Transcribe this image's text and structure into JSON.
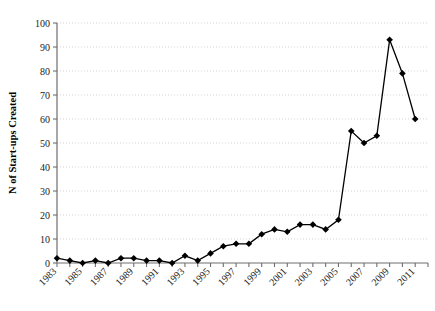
{
  "chart_data": {
    "type": "line",
    "title": "",
    "subtitle": "",
    "xlabel": "",
    "ylabel": "N of Start-ups Created",
    "xlim": [
      1983,
      2012
    ],
    "ylim": [
      0,
      100
    ],
    "ytick_step": 10,
    "yticks": [
      0,
      10,
      20,
      30,
      40,
      50,
      60,
      70,
      80,
      90,
      100
    ],
    "ytick_labels": [
      "0",
      "10",
      "20",
      "30",
      "40",
      "50",
      "60",
      "70",
      "80",
      "90",
      "100"
    ],
    "xticks": [
      1983,
      1984,
      1985,
      1986,
      1987,
      1988,
      1989,
      1990,
      1991,
      1992,
      1993,
      1994,
      1995,
      1996,
      1997,
      1998,
      1999,
      2000,
      2001,
      2002,
      2003,
      2004,
      2005,
      2006,
      2007,
      2008,
      2009,
      2010,
      2011,
      2012
    ],
    "xtick_labels": [
      "1983",
      "",
      "1985",
      "",
      "1987",
      "",
      "1989",
      "",
      "1991",
      "",
      "1993",
      "",
      "1995",
      "",
      "1997",
      "",
      "1999",
      "",
      "2001",
      "",
      "2003",
      "",
      "2005",
      "",
      "2007",
      "",
      "2009",
      "",
      "2011",
      ""
    ],
    "xtick_label_rotation": 45,
    "grid": "horizontal-dotted",
    "legend": "none",
    "marker": "diamond",
    "line_color": "#000000",
    "marker_color": "#000000",
    "grid_color": "#c8c8c8",
    "axis_color": "#6e6e6e",
    "x": [
      1983,
      1984,
      1985,
      1986,
      1987,
      1988,
      1989,
      1990,
      1991,
      1992,
      1993,
      1994,
      1995,
      1996,
      1997,
      1998,
      1999,
      2000,
      2001,
      2002,
      2003,
      2004,
      2005,
      2006,
      2007,
      2008,
      2009,
      2010,
      2011
    ],
    "values": [
      2,
      1,
      0,
      1,
      0,
      2,
      2,
      1,
      1,
      0,
      3,
      1,
      4,
      7,
      8,
      8,
      12,
      14,
      13,
      16,
      16,
      14,
      18,
      55,
      50,
      53,
      93,
      79,
      60
    ],
    "series": [
      {
        "name": "N of Start-ups Created",
        "values": [
          2,
          1,
          0,
          1,
          0,
          2,
          2,
          1,
          1,
          0,
          3,
          1,
          4,
          7,
          8,
          8,
          12,
          14,
          13,
          16,
          16,
          14,
          18,
          55,
          50,
          53,
          93,
          79,
          60
        ]
      }
    ]
  }
}
